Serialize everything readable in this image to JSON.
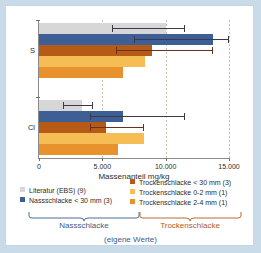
{
  "chart_data": {
    "type": "bar",
    "orientation": "horizontal",
    "title": "",
    "xlabel": "Massenanteil  mg/kg",
    "ylabel": "",
    "xlim": [
      0,
      15000
    ],
    "xticks": [
      0,
      5000,
      10000,
      15000
    ],
    "xtick_labels": [
      "0",
      "5.000",
      "10.000",
      "15.000"
    ],
    "categories": [
      "S",
      "Cl"
    ],
    "grid": "vertical-dashed",
    "legend_position": "bottom",
    "series": [
      {
        "name": "Literatur (EBS) (9)",
        "color": "#d7d7d7",
        "values": [
          10000,
          3400
        ],
        "errors": [
          {
            "low": 5800,
            "high": 11500
          },
          {
            "low": 1900,
            "high": 4300
          }
        ]
      },
      {
        "name": "Nassschlacke < 30 mm (3)",
        "color": "#3e5f96",
        "values": [
          13700,
          6600
        ],
        "errors": [
          {
            "low": 7500,
            "high": 15000
          },
          {
            "low": 4000,
            "high": 11500
          }
        ]
      },
      {
        "name": "Trockenschlacke < 30 mm (3)",
        "color": "#b55a17",
        "values": [
          8900,
          5300
        ],
        "errors": [
          {
            "low": 6100,
            "high": 13700
          },
          {
            "low": 4000,
            "high": 8300
          }
        ]
      },
      {
        "name": "Trockenschlacke 0-2 mm (1)",
        "color": "#f7bd55",
        "values": [
          8400,
          8300
        ],
        "errors": [
          null,
          null
        ]
      },
      {
        "name": "Trockenschlacke 2-4 mm (1)",
        "color": "#e8922e",
        "values": [
          6600,
          6200
        ],
        "errors": [
          null,
          null
        ]
      }
    ]
  },
  "axis": {
    "x_title": "Massenanteil  mg/kg",
    "tick_labels": [
      "0",
      "5.000",
      "10.000",
      "15.000"
    ],
    "category_labels": [
      "S",
      "Cl"
    ]
  },
  "legend": {
    "left_column": [
      {
        "label": "Literatur (EBS) (9)",
        "color": "#d7d7d7"
      },
      {
        "label": "Nassschlacke < 30 mm (3)",
        "color": "#3e5f96"
      }
    ],
    "right_column": [
      {
        "label": "Trockenschlacke < 30 mm (3)",
        "color": "#b55a17"
      },
      {
        "label": "Trockenschlacke 0-2 mm (1)",
        "color": "#f7bd55"
      },
      {
        "label": "Trockenschlacke 2-4 mm (1)",
        "color": "#e8922e"
      }
    ]
  },
  "braces": {
    "left_label": "Nassschlacke",
    "right_label": "Trockenschlacke",
    "footer_label": "(eigene Werte)",
    "left_color": "#3b5c86",
    "right_color": "#b55a17"
  },
  "colors": {
    "page_background": "#c9dae8",
    "figure_background": "#ffffff",
    "figure_border": "#bcd8ea",
    "axis": "#8a8a8a",
    "grid": "#c9c0b4",
    "error_dark": "#3a3a4a",
    "error_brown": "#6b2f20",
    "text": "#2c2c2c"
  }
}
